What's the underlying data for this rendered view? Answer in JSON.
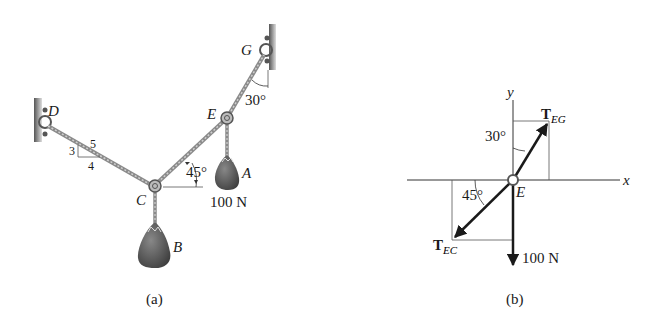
{
  "figure_a": {
    "caption": "(a)",
    "points": {
      "D": "D",
      "C": "C",
      "E": "E",
      "G": "G",
      "A": "A",
      "B": "B"
    },
    "slope_triangle": {
      "rise": "3",
      "run": "4",
      "hyp": "5"
    },
    "angle_CE": "45°",
    "angle_EG": "30°",
    "weight_A": "100 N"
  },
  "figure_b": {
    "caption": "(b)",
    "axis_x": "x",
    "axis_y": "y",
    "origin": "E",
    "force_EG": {
      "main": "T",
      "sub": "EG"
    },
    "force_EC": {
      "main": "T",
      "sub": "EC"
    },
    "angle_EG": "30°",
    "angle_EC": "45°",
    "load": "100 N"
  },
  "colors": {
    "line": "#1a1a1a",
    "cable": "#8a8a8a",
    "weight": "#555555",
    "wall": "#777777"
  }
}
